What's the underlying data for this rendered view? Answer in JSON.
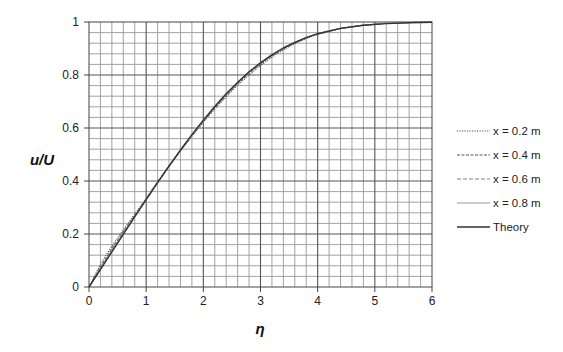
{
  "chart_data": {
    "type": "line",
    "title": "",
    "xlabel": "η",
    "ylabel": "u/U",
    "xlim": [
      0,
      6
    ],
    "ylim": [
      0,
      1
    ],
    "x_ticks": [
      "0",
      "1",
      "2",
      "3",
      "4",
      "5",
      "6"
    ],
    "y_ticks": [
      "0",
      "0.2",
      "0.4",
      "0.6",
      "0.8",
      "1"
    ],
    "grid": true,
    "grid_minor_x_step": 0.2,
    "grid_minor_y_step": 0.04,
    "legend_position": "right",
    "x": [
      0,
      0.2,
      0.4,
      0.6,
      0.8,
      1.0,
      1.2,
      1.4,
      1.6,
      1.8,
      2.0,
      2.2,
      2.4,
      2.6,
      2.8,
      3.0,
      3.2,
      3.4,
      3.6,
      3.8,
      4.0,
      4.4,
      4.8,
      5.2,
      5.6,
      6.0
    ],
    "series": [
      {
        "name": "x = 0.2 m",
        "style": "dotted",
        "color": "#555555",
        "values": [
          0,
          0.085,
          0.155,
          0.215,
          0.275,
          0.335,
          0.398,
          0.458,
          0.515,
          0.57,
          0.622,
          0.672,
          0.718,
          0.762,
          0.8,
          0.836,
          0.867,
          0.895,
          0.918,
          0.938,
          0.953,
          0.975,
          0.988,
          0.995,
          0.998,
          1.0
        ]
      },
      {
        "name": "x = 0.4 m",
        "style": "dashed",
        "color": "#555555",
        "values": [
          0,
          0.075,
          0.145,
          0.208,
          0.27,
          0.332,
          0.395,
          0.456,
          0.514,
          0.57,
          0.624,
          0.676,
          0.723,
          0.767,
          0.806,
          0.841,
          0.872,
          0.899,
          0.921,
          0.94,
          0.955,
          0.976,
          0.988,
          0.995,
          0.998,
          1.0
        ]
      },
      {
        "name": "x = 0.6 m",
        "style": "long-dash",
        "color": "#888888",
        "values": [
          0,
          0.07,
          0.14,
          0.204,
          0.268,
          0.331,
          0.394,
          0.455,
          0.514,
          0.571,
          0.626,
          0.678,
          0.726,
          0.77,
          0.809,
          0.844,
          0.875,
          0.901,
          0.923,
          0.941,
          0.956,
          0.976,
          0.988,
          0.995,
          0.998,
          1.0
        ]
      },
      {
        "name": "x = 0.8 m",
        "style": "solid",
        "color": "#999999",
        "values": [
          0,
          0.068,
          0.137,
          0.202,
          0.267,
          0.331,
          0.394,
          0.456,
          0.516,
          0.574,
          0.629,
          0.681,
          0.729,
          0.773,
          0.812,
          0.846,
          0.876,
          0.902,
          0.923,
          0.941,
          0.956,
          0.976,
          0.988,
          0.995,
          0.998,
          1.0
        ]
      },
      {
        "name": "Theory",
        "style": "solid",
        "color": "#333333",
        "values": [
          0,
          0.066,
          0.133,
          0.199,
          0.265,
          0.33,
          0.394,
          0.456,
          0.517,
          0.575,
          0.63,
          0.681,
          0.729,
          0.772,
          0.812,
          0.846,
          0.876,
          0.902,
          0.923,
          0.941,
          0.956,
          0.976,
          0.988,
          0.994,
          0.997,
          0.999
        ]
      }
    ]
  }
}
